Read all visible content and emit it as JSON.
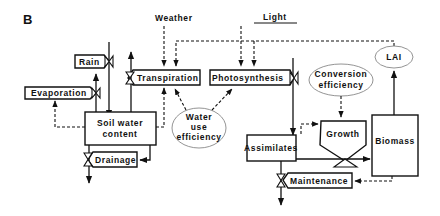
{
  "panel_label": "B",
  "drivers": {
    "weather": "Weather",
    "light": "Light"
  },
  "states": {
    "soil_water": [
      "Soil water",
      "content"
    ],
    "assimilates": "Assimilates",
    "biomass": "Biomass"
  },
  "flows": {
    "rain": "Rain",
    "evaporation": "Evaporation",
    "drainage": "Drainage",
    "transpiration": "Transpiration",
    "photosynthesis": "Photosynthesis",
    "growth": "Growth",
    "maintenance": "Maintenance"
  },
  "parameters": {
    "water_use_efficiency": [
      "Water",
      "use",
      "efficiency"
    ],
    "conversion_efficiency": [
      "Conversion",
      "efficiency"
    ],
    "lai": "LAI"
  },
  "legend_note": {
    "solid_lines": "material flow",
    "dashed_lines": "information flow"
  }
}
